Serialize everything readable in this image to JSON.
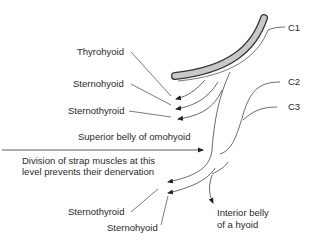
{
  "labels": {
    "c1": "C1",
    "c2": "C2",
    "c3": "C3",
    "thyrohyoid": "Thyrohyoid",
    "sternohyoid_upper": "Sternohyoid",
    "sternothyroid_upper": "Sternothyroid",
    "superior_belly": "Superior belly of omohyoid",
    "division_line1": "Division of strap muscles at this",
    "division_line2": "level prevents their denervation",
    "sternothyroid_lower": "Sternothyroid",
    "sternohyoid_lower": "Sternohyoid",
    "inferior_belly_line1": "Interior belly",
    "inferior_belly_line2": "of a hyoid"
  },
  "colors": {
    "bone_fill": "#c8c8c8",
    "line": "#333333"
  }
}
